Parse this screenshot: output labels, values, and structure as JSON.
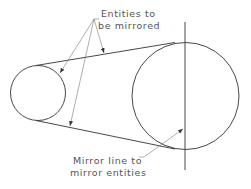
{
  "diagram": {
    "labels": {
      "entities_line1": "Entities to",
      "entities_line2": "be mirrored",
      "mirror_line1": "Mirror line to",
      "mirror_line2": "mirror entities"
    },
    "colors": {
      "stroke": "#333333",
      "leader": "#777777",
      "text": "#555555"
    }
  }
}
